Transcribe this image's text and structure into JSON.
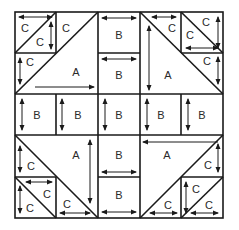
{
  "diagram": {
    "type": "quilt-block-pattern",
    "grid": {
      "columns": 5,
      "rows": 5
    },
    "colors": {
      "line": "#1a1a1a",
      "background": "#ffffff"
    },
    "pieces": {
      "A": "A",
      "B": "B",
      "C": "C"
    },
    "labels": {
      "tl_c1": "C",
      "tl_c2": "C",
      "tl_c3": "C",
      "tl_c4": "C",
      "tl_a": "A",
      "tr_c1": "C",
      "tr_c2": "C",
      "tr_c3": "C",
      "tr_c4": "C",
      "tr_a": "A",
      "bl_c1": "C",
      "bl_c2": "C",
      "bl_c3": "C",
      "bl_c4": "C",
      "bl_a": "A",
      "br_c1": "C",
      "br_c2": "C",
      "br_c3": "C",
      "br_c4": "C",
      "br_a": "A",
      "b_top1": "B",
      "b_top2": "B",
      "b_mid1": "B",
      "b_mid2": "B",
      "b_mid3": "B",
      "b_mid4": "B",
      "b_mid5": "B",
      "b_bot1": "B",
      "b_bot2": "B",
      "b_left1": "B",
      "b_right1": "B"
    }
  }
}
